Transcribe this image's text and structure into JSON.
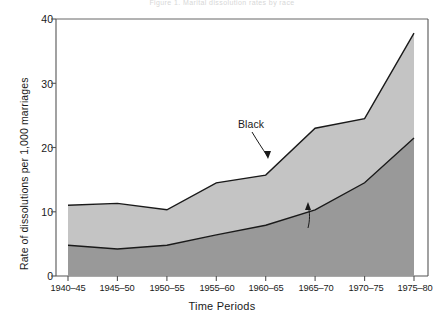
{
  "figure": {
    "faint_top_text": "Figure 1. Marital dissolution rates by race",
    "background_color": "#ffffff"
  },
  "chart_data": {
    "type": "area",
    "stacked": true,
    "title": "",
    "xlabel": "Time Periods",
    "ylabel": "Rate of dissolutions per 1,000 marriages",
    "categories": [
      "1940–45",
      "1945–50",
      "1950–55",
      "1955–60",
      "1960–65",
      "1965–70",
      "1970–75",
      "1975–80"
    ],
    "x_tick_labels": [
      "1940–45",
      "1945–50",
      "1950–55",
      "1955–60",
      "1960–65",
      "1965–70",
      "1970–75",
      "1975–80"
    ],
    "y_tick_labels": [
      "0",
      "10",
      "20",
      "30",
      "40"
    ],
    "y_ticks": [
      0,
      10,
      20,
      30,
      40
    ],
    "ylim": [
      0,
      40
    ],
    "grid": false,
    "legend_position": "inline-annotations",
    "series": [
      {
        "name": "White",
        "fill_color": "#999999",
        "values": [
          4.8,
          4.2,
          4.8,
          6.4,
          7.9,
          10.3,
          14.5,
          21.5
        ]
      },
      {
        "name": "Black",
        "fill_color": "#c4c4c4",
        "values": [
          11.0,
          11.3,
          10.3,
          14.5,
          15.7,
          23.0,
          24.5,
          37.8
        ]
      }
    ],
    "annotations": [
      {
        "label": "Black",
        "x_px": 238,
        "y_px": 124
      },
      {
        "label": "White",
        "x_px": 303,
        "y_px": 236
      }
    ],
    "colors": {
      "upper_band": "#c4c4c4",
      "lower_band": "#999999",
      "axis": "#555555",
      "line": "#1a1a1a"
    }
  }
}
